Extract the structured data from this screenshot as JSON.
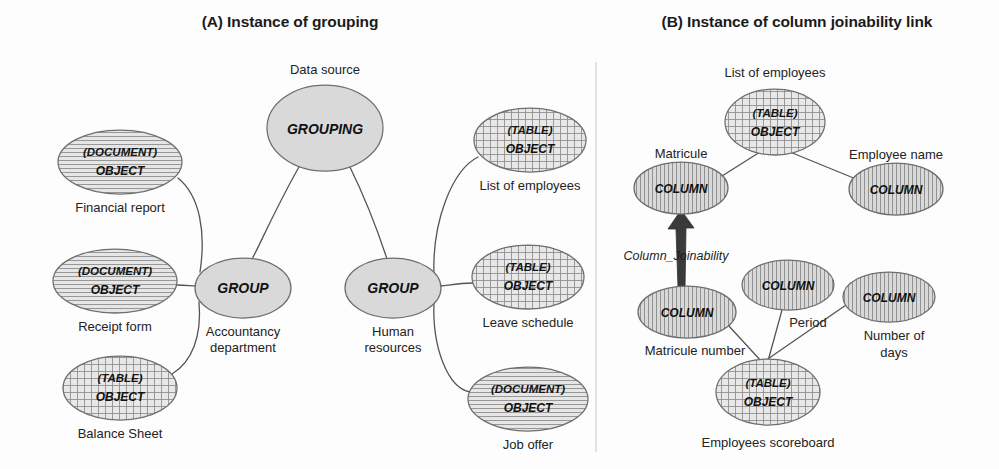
{
  "figure": {
    "background_color": "#fdfdfd",
    "width": 999,
    "height": 469
  },
  "panels": [
    {
      "id": "panel-a",
      "title": "(A) Instance of grouping",
      "title_x": 290,
      "title_y": 27
    },
    {
      "id": "panel-b",
      "title": "(B) Instance of column joinability link",
      "title_x": 797,
      "title_y": 27
    }
  ],
  "legend_colors": {
    "plain_fill": "#d9d9d9",
    "hatch_stroke": "#8a8a8a",
    "outline": "#6e6e6e",
    "connector": "#555555",
    "arrow": "#3a3a3a",
    "divider": "#cfcfcf",
    "text": "#1b1b1b"
  },
  "panel_a": {
    "root": {
      "name": "grouping-node",
      "kind": "GROUPING",
      "caption": "Data source",
      "caption_position": "above",
      "fill": "plain",
      "cx": 325,
      "cy": 128,
      "rx": 58,
      "ry": 43
    },
    "groups": [
      {
        "name": "group-accountancy",
        "kind": "GROUP",
        "caption_line1": "Accountancy",
        "caption_line2": "department",
        "fill": "plain",
        "cx": 243,
        "cy": 288,
        "rx": 48,
        "ry": 30
      },
      {
        "name": "group-human-resources",
        "kind": "GROUP",
        "caption_line1": "Human",
        "caption_line2": "resources",
        "fill": "plain",
        "cx": 393,
        "cy": 288,
        "rx": 48,
        "ry": 30
      }
    ],
    "objects": [
      {
        "name": "object-financial-report",
        "type": "(DOCUMENT)",
        "kind": "OBJECT",
        "caption": "Financial report",
        "fill": "horizontal-hatch",
        "cx": 120,
        "cy": 162,
        "rx": 62,
        "ry": 32
      },
      {
        "name": "object-receipt-form",
        "type": "(DOCUMENT)",
        "kind": "OBJECT",
        "caption": "Receipt form",
        "fill": "horizontal-hatch",
        "cx": 115,
        "cy": 281,
        "rx": 62,
        "ry": 32
      },
      {
        "name": "object-balance-sheet",
        "type": "(TABLE)",
        "kind": "OBJECT",
        "caption": "Balance Sheet",
        "fill": "cross-hatch",
        "cx": 120,
        "cy": 388,
        "rx": 57,
        "ry": 32
      },
      {
        "name": "object-list-of-employees",
        "type": "(TABLE)",
        "kind": "OBJECT",
        "caption": "List of employees",
        "fill": "cross-hatch",
        "cx": 530,
        "cy": 140,
        "rx": 56,
        "ry": 32
      },
      {
        "name": "object-leave-schedule",
        "type": "(TABLE)",
        "kind": "OBJECT",
        "caption": "Leave schedule",
        "fill": "cross-hatch",
        "cx": 528,
        "cy": 277,
        "rx": 56,
        "ry": 32
      },
      {
        "name": "object-job-offer",
        "type": "(DOCUMENT)",
        "kind": "OBJECT",
        "caption": "Job offer",
        "fill": "horizontal-hatch",
        "cx": 528,
        "cy": 399,
        "rx": 60,
        "ry": 32
      }
    ]
  },
  "panel_b": {
    "nodes": [
      {
        "name": "table-list-of-employees",
        "type": "(TABLE)",
        "kind": "OBJECT",
        "caption": "List of employees",
        "caption_position": "above",
        "fill": "cross-hatch",
        "cx": 775,
        "cy": 122,
        "rx": 50,
        "ry": 33
      },
      {
        "name": "column-matricule",
        "kind": "COLUMN",
        "caption": "Matricule",
        "caption_position": "above-left",
        "fill": "vertical-hatch",
        "cx": 681,
        "cy": 188,
        "rx": 47,
        "ry": 26
      },
      {
        "name": "column-employee-name",
        "kind": "COLUMN",
        "caption": "Employee name",
        "caption_position": "above-right",
        "fill": "vertical-hatch",
        "cx": 896,
        "cy": 189,
        "rx": 47,
        "ry": 26
      },
      {
        "name": "column-matricule-number",
        "kind": "COLUMN",
        "caption": "Matricule number",
        "caption_position": "below",
        "fill": "vertical-hatch",
        "cx": 687,
        "cy": 312,
        "rx": 49,
        "ry": 26
      },
      {
        "name": "column-period",
        "kind": "COLUMN",
        "caption": "Period",
        "caption_position": "below-right",
        "fill": "vertical-hatch",
        "cx": 788,
        "cy": 285,
        "rx": 46,
        "ry": 25
      },
      {
        "name": "column-number-of-days",
        "kind": "COLUMN",
        "caption_line1": "Number of",
        "caption_line2": "days",
        "caption_position": "below",
        "fill": "vertical-hatch",
        "cx": 889,
        "cy": 297,
        "rx": 46,
        "ry": 25
      },
      {
        "name": "table-employees-scoreboard",
        "type": "(TABLE)",
        "kind": "OBJECT",
        "caption": "Employees scoreboard",
        "caption_position": "below",
        "fill": "cross-hatch",
        "cx": 768,
        "cy": 392,
        "rx": 52,
        "ry": 33
      }
    ],
    "joinability_edge": {
      "name": "column-joinability-arrow",
      "label": "Column_Joinability",
      "label_x": 676,
      "label_y": 260,
      "from": "column-matricule-number",
      "to": "column-matricule"
    }
  }
}
